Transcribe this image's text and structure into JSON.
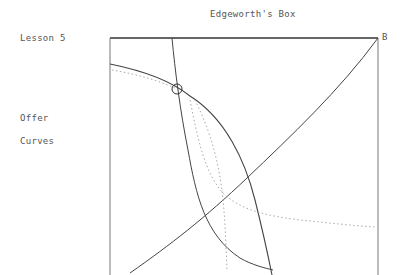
{
  "header": {
    "title": "Edgeworth's Box",
    "lesson": "Lesson 5"
  },
  "sidebar": {
    "topic_line1": "Offer",
    "topic_line2": "Curves"
  },
  "diagram": {
    "corner_label_top_right": "B",
    "box": {
      "left": 110,
      "top": 38,
      "right": 378,
      "bottom": 275
    },
    "colors": {
      "box": "#333333",
      "solid_curve": "#444444",
      "dotted_curve": "#999999",
      "text": "#555555"
    },
    "marker": {
      "type": "circle",
      "cx": 177,
      "cy": 89,
      "r": 5
    }
  }
}
